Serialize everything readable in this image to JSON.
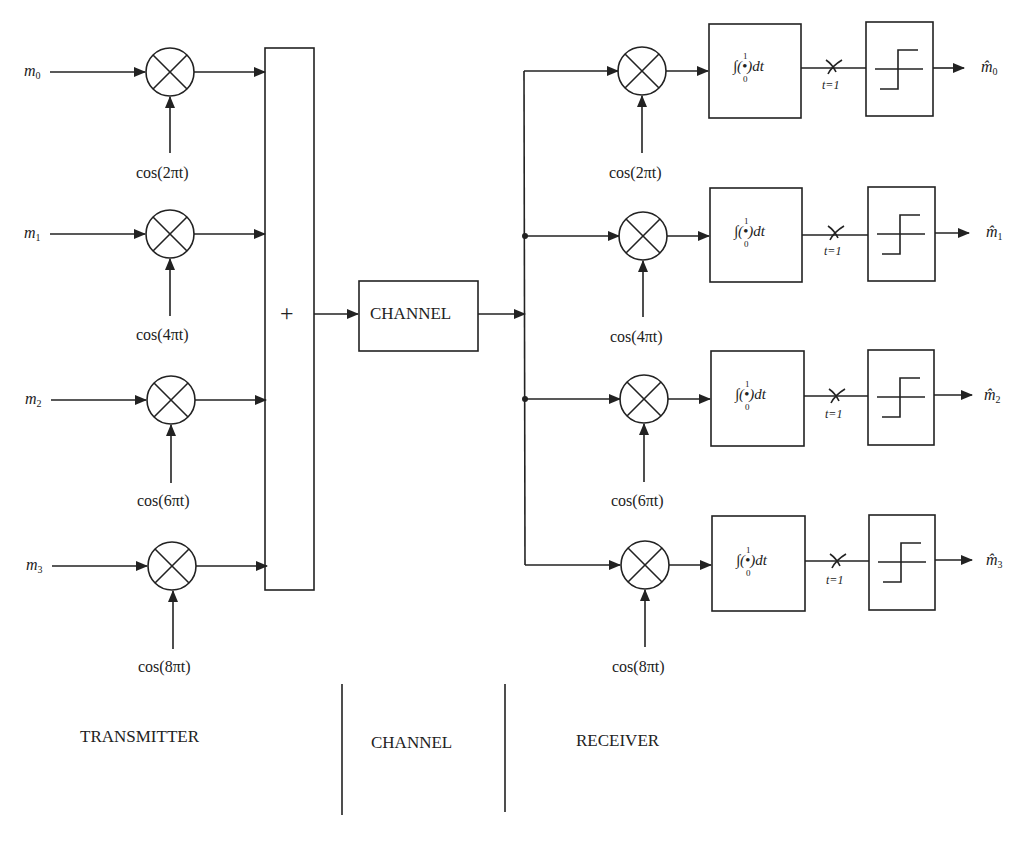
{
  "diagram": {
    "title": "",
    "transmitter": {
      "inputs": [
        {
          "symbol": "m",
          "index": "0",
          "carrier": "cos(2πt)"
        },
        {
          "symbol": "m",
          "index": "1",
          "carrier": "cos(4πt)"
        },
        {
          "symbol": "m",
          "index": "2",
          "carrier": "cos(6πt)"
        },
        {
          "symbol": "m",
          "index": "3",
          "carrier": "cos(8πt)"
        }
      ],
      "summer_symbol": "+",
      "mixer_symbol": "⊗"
    },
    "channel": {
      "label": "CHANNEL"
    },
    "receiver": {
      "branches": [
        {
          "carrier": "cos(2πt)",
          "integrator": "∫(•)dt",
          "int_lower": "0",
          "int_upper": "1",
          "sample": "t=1",
          "output_symbol": "m̂",
          "output_index": "0"
        },
        {
          "carrier": "cos(4πt)",
          "integrator": "∫(•)dt",
          "int_lower": "0",
          "int_upper": "1",
          "sample": "t=1",
          "output_symbol": "m̂",
          "output_index": "1"
        },
        {
          "carrier": "cos(6πt)",
          "integrator": "∫(•)dt",
          "int_lower": "0",
          "int_upper": "1",
          "sample": "t=1",
          "output_symbol": "m̂",
          "output_index": "2"
        },
        {
          "carrier": "cos(8πt)",
          "integrator": "∫(•)dt",
          "int_lower": "0",
          "int_upper": "1",
          "sample": "t=1",
          "output_symbol": "m̂",
          "output_index": "3"
        }
      ]
    },
    "sections": [
      {
        "label": "TRANSMITTER"
      },
      {
        "label": "CHANNEL"
      },
      {
        "label": "RECEIVER"
      }
    ],
    "colors": {
      "line": "#222222",
      "background": "#ffffff"
    }
  }
}
